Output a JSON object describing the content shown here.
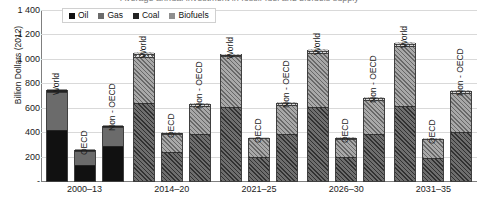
{
  "chart_data": {
    "type": "bar",
    "subtype": "stacked",
    "title": "Average annual investment in fossil-fuel and biofuels supply",
    "ylabel": "Billion Dollars (2012)",
    "xlabel": "",
    "ylim": [
      0,
      1400
    ],
    "ytick_values": [
      0,
      200,
      400,
      600,
      800,
      1000,
      1200,
      1400
    ],
    "ytick_labels": [
      "-",
      "200",
      "400",
      "600",
      "800",
      "1 000",
      "1 200",
      "1 400"
    ],
    "grid": true,
    "legend_position": "top-left-inside",
    "categories": [
      "2000–13",
      "2014–20",
      "2021–25",
      "2026–30",
      "2031–35"
    ],
    "subcategories": [
      "World",
      "OECD",
      "Non - OECD"
    ],
    "series": [
      {
        "name": "Oil",
        "color": "#111111",
        "pattern_solid": "solid",
        "pattern_hatch": "diagonal",
        "values": [
          [
            420,
            130,
            283
          ],
          [
            640,
            240,
            382
          ],
          [
            605,
            200,
            385
          ],
          [
            610,
            196,
            388
          ],
          [
            615,
            185,
            400
          ]
        ]
      },
      {
        "name": "Gas",
        "color": "#6b6b6b",
        "pattern_solid": "solid",
        "pattern_hatch": "diagonal-light",
        "values": [
          [
            305,
            115,
            163
          ],
          [
            375,
            145,
            230
          ],
          [
            415,
            150,
            240
          ],
          [
            440,
            148,
            275
          ],
          [
            490,
            155,
            320
          ]
        ]
      },
      {
        "name": "Coal",
        "color": "#232323",
        "pattern_solid": "solid",
        "pattern_hatch": "cross-hatch",
        "values": [
          [
            25,
            14,
            12
          ],
          [
            28,
            8,
            15
          ],
          [
            14,
            8,
            12
          ],
          [
            18,
            8,
            14
          ],
          [
            20,
            8,
            14
          ]
        ]
      },
      {
        "name": "Biofuels",
        "color": "#8f8f8f",
        "pattern_solid": "solid",
        "pattern_hatch": "diagonal-faint",
        "values": [
          [
            5,
            3,
            3
          ],
          [
            15,
            5,
            10
          ],
          [
            10,
            5,
            8
          ],
          [
            14,
            6,
            12
          ],
          [
            16,
            7,
            14
          ]
        ]
      }
    ],
    "totals": [
      [
        755,
        262,
        461
      ],
      [
        1058,
        398,
        637
      ],
      [
        1044,
        363,
        645
      ],
      [
        1082,
        358,
        689
      ],
      [
        1141,
        355,
        748
      ]
    ]
  },
  "legend": {
    "items": [
      {
        "label": "Oil"
      },
      {
        "label": "Gas"
      },
      {
        "label": "Coal"
      },
      {
        "label": "Biofuels"
      }
    ]
  }
}
